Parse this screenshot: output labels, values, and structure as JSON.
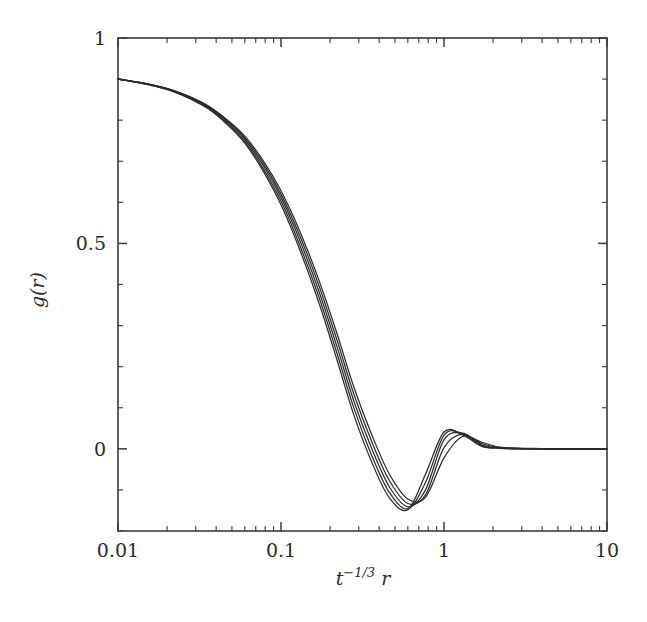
{
  "figure": {
    "title": "",
    "background_color": "#ffffff",
    "line_color": "#2b2b2b",
    "axis_color": "#3a3a3a"
  },
  "axes": {
    "x": {
      "label_base": "t",
      "label_exponent": "−1/3",
      "label_var": "r",
      "scale": "log",
      "min": 0.01,
      "max": 10,
      "tick_labels": [
        "0.01",
        "0.1",
        "1",
        "10"
      ],
      "tick_values": [
        0.01,
        0.1,
        1,
        10
      ],
      "minor_ticks": true
    },
    "y": {
      "label": "g(r)",
      "scale": "linear",
      "min": -0.2,
      "max": 1.0,
      "tick_labels": [
        "1",
        "0.5",
        "0"
      ],
      "tick_values": [
        1,
        0.5,
        0
      ],
      "minor_tick_values": [
        0.9,
        0.8,
        0.7,
        0.6,
        0.4,
        0.3,
        0.2,
        0.1,
        -0.1,
        -0.2
      ]
    },
    "frame": {
      "left_px": 118,
      "right_px": 607,
      "top_px": 38,
      "bottom_px": 531
    },
    "ticks_direction": "in"
  },
  "chart_data": {
    "type": "line",
    "title": "",
    "xlabel": "t^-1/3 r",
    "ylabel": "g(r)",
    "xscale": "log",
    "xlim": [
      0.01,
      10
    ],
    "ylim": [
      -0.2,
      1.0
    ],
    "grid": false,
    "legend": "none",
    "n_series": 5,
    "x": [
      0.01,
      0.013,
      0.017,
      0.022,
      0.028,
      0.036,
      0.046,
      0.06,
      0.077,
      0.1,
      0.13,
      0.17,
      0.22,
      0.28,
      0.36,
      0.46,
      0.6,
      0.77,
      1.0,
      1.3,
      1.7,
      2.2,
      2.8,
      3.6,
      4.6,
      6.0,
      7.7,
      10.0
    ],
    "series": [
      {
        "name": "t1",
        "values": [
          0.9,
          0.893,
          0.884,
          0.872,
          0.856,
          0.834,
          0.803,
          0.761,
          0.704,
          0.628,
          0.531,
          0.413,
          0.282,
          0.15,
          0.035,
          -0.06,
          -0.122,
          -0.118,
          -0.022,
          0.03,
          0.016,
          0.004,
          0.002,
          0.001,
          0.0,
          0.0,
          0.0,
          0.0
        ]
      },
      {
        "name": "t2",
        "values": [
          0.9,
          0.893,
          0.884,
          0.872,
          0.855,
          0.833,
          0.801,
          0.757,
          0.698,
          0.62,
          0.52,
          0.4,
          0.266,
          0.133,
          0.018,
          -0.076,
          -0.133,
          -0.112,
          0.003,
          0.036,
          0.013,
          0.003,
          0.001,
          0.0,
          0.0,
          0.0,
          0.0,
          0.0
        ]
      },
      {
        "name": "t3",
        "values": [
          0.9,
          0.893,
          0.883,
          0.871,
          0.854,
          0.831,
          0.798,
          0.753,
          0.692,
          0.612,
          0.509,
          0.386,
          0.25,
          0.116,
          0.001,
          -0.091,
          -0.141,
          -0.1,
          0.022,
          0.038,
          0.01,
          0.002,
          0.001,
          0.0,
          0.0,
          0.0,
          0.0,
          0.0
        ]
      },
      {
        "name": "t4",
        "values": [
          0.9,
          0.892,
          0.883,
          0.87,
          0.853,
          0.829,
          0.795,
          0.748,
          0.685,
          0.603,
          0.497,
          0.372,
          0.234,
          0.099,
          -0.016,
          -0.105,
          -0.146,
          -0.082,
          0.033,
          0.037,
          0.008,
          0.002,
          0.0,
          0.0,
          0.0,
          0.0,
          0.0,
          0.0
        ]
      },
      {
        "name": "t5",
        "values": [
          0.9,
          0.892,
          0.882,
          0.869,
          0.851,
          0.827,
          0.792,
          0.744,
          0.679,
          0.594,
          0.486,
          0.358,
          0.218,
          0.082,
          -0.032,
          -0.118,
          -0.148,
          -0.062,
          0.041,
          0.034,
          0.006,
          0.001,
          0.0,
          0.0,
          0.0,
          0.0,
          0.0,
          0.0
        ]
      }
    ]
  }
}
